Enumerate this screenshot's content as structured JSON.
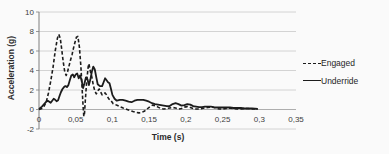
{
  "chart_data": {
    "type": "line",
    "title": "",
    "xlabel": "Time (s)",
    "ylabel": "Acceleration (g)",
    "xlim": [
      0,
      0.35
    ],
    "ylim": [
      -2,
      10
    ],
    "grid": "horizontal",
    "legend_position": "right",
    "decimal_separator": ",",
    "x_ticks": [
      {
        "value": 0,
        "label": "0"
      },
      {
        "value": 0.05,
        "label": "0,05"
      },
      {
        "value": 0.1,
        "label": "0,1"
      },
      {
        "value": 0.15,
        "label": "0,15"
      },
      {
        "value": 0.2,
        "label": "0,2"
      },
      {
        "value": 0.25,
        "label": "0,25"
      },
      {
        "value": 0.3,
        "label": "0,3"
      },
      {
        "value": 0.35,
        "label": "0,35"
      }
    ],
    "y_ticks": [
      {
        "value": -2,
        "label": "-2"
      },
      {
        "value": 0,
        "label": "0"
      },
      {
        "value": 2,
        "label": "2"
      },
      {
        "value": 4,
        "label": "4"
      },
      {
        "value": 6,
        "label": "6"
      },
      {
        "value": 8,
        "label": "8"
      },
      {
        "value": 10,
        "label": "10"
      }
    ],
    "colors": {
      "line": "#1c1c1c",
      "grid": "#c9c9c9",
      "zero_axis": "#9a9a9a",
      "axis": "#7f7f7f",
      "tick_text": "#3d3d3d"
    },
    "series": [
      {
        "name": "Engaged",
        "style": "dashed",
        "points": [
          [
            0,
            0
          ],
          [
            0.004,
            0.1
          ],
          [
            0.007,
            0.35
          ],
          [
            0.01,
            0.8
          ],
          [
            0.013,
            1.7
          ],
          [
            0.016,
            2.9
          ],
          [
            0.019,
            4.3
          ],
          [
            0.022,
            6.0
          ],
          [
            0.025,
            7.3
          ],
          [
            0.027,
            7.7
          ],
          [
            0.029,
            7.3
          ],
          [
            0.031,
            6.1
          ],
          [
            0.033,
            4.9
          ],
          [
            0.035,
            3.9
          ],
          [
            0.037,
            3.5
          ],
          [
            0.039,
            3.9
          ],
          [
            0.041,
            4.5
          ],
          [
            0.043,
            5.1
          ],
          [
            0.045,
            5.6
          ],
          [
            0.047,
            6.3
          ],
          [
            0.049,
            6.9
          ],
          [
            0.051,
            7.4
          ],
          [
            0.053,
            7.5
          ],
          [
            0.055,
            6.4
          ],
          [
            0.057,
            4.4
          ],
          [
            0.059,
            1.8
          ],
          [
            0.06,
            0.3
          ],
          [
            0.061,
            -0.7
          ],
          [
            0.062,
            -0.4
          ],
          [
            0.063,
            0.9
          ],
          [
            0.065,
            2.9
          ],
          [
            0.067,
            4.4
          ],
          [
            0.068,
            4.7
          ],
          [
            0.07,
            3.9
          ],
          [
            0.072,
            3.3
          ],
          [
            0.074,
            2.5
          ],
          [
            0.076,
            1.9
          ],
          [
            0.078,
            1.6
          ],
          [
            0.08,
            1.9
          ],
          [
            0.082,
            2.1
          ],
          [
            0.084,
            1.8
          ],
          [
            0.086,
            1.5
          ],
          [
            0.088,
            1.6
          ],
          [
            0.09,
            1.7
          ],
          [
            0.092,
            1.5
          ],
          [
            0.095,
            1.1
          ],
          [
            0.098,
            0.9
          ],
          [
            0.101,
            0.6
          ],
          [
            0.104,
            0.5
          ],
          [
            0.107,
            0.4
          ],
          [
            0.11,
            0.3
          ],
          [
            0.113,
            0.2
          ],
          [
            0.116,
            0.1
          ],
          [
            0.12,
            0
          ],
          [
            0.124,
            -0.1
          ],
          [
            0.128,
            -0.2
          ],
          [
            0.132,
            -0.3
          ],
          [
            0.136,
            -0.35
          ],
          [
            0.14,
            -0.3
          ],
          [
            0.144,
            -0.15
          ],
          [
            0.148,
            0.1
          ],
          [
            0.152,
            0.35
          ],
          [
            0.155,
            0.45
          ],
          [
            0.158,
            0.4
          ],
          [
            0.162,
            0.25
          ],
          [
            0.166,
            0.1
          ],
          [
            0.17,
            0.05
          ],
          [
            0.174,
            0.1
          ],
          [
            0.178,
            0.15
          ],
          [
            0.182,
            0.2
          ],
          [
            0.186,
            0.15
          ],
          [
            0.19,
            0.05
          ],
          [
            0.194,
            0.1
          ],
          [
            0.198,
            0.25
          ],
          [
            0.202,
            0.3
          ],
          [
            0.206,
            0.2
          ],
          [
            0.21,
            0.1
          ],
          [
            0.214,
            0.05
          ],
          [
            0.218,
            0.05
          ],
          [
            0.222,
            0.1
          ],
          [
            0.226,
            0.15
          ],
          [
            0.23,
            0.2
          ],
          [
            0.234,
            0.25
          ],
          [
            0.238,
            0.2
          ],
          [
            0.242,
            0.1
          ],
          [
            0.246,
            0.05
          ],
          [
            0.25,
            0.05
          ],
          [
            0.255,
            0.1
          ],
          [
            0.26,
            0.15
          ],
          [
            0.265,
            0.1
          ],
          [
            0.27,
            0.05
          ],
          [
            0.275,
            0.05
          ],
          [
            0.28,
            0.1
          ],
          [
            0.285,
            0.1
          ],
          [
            0.29,
            0.05
          ],
          [
            0.294,
            0.05
          ],
          [
            0.298,
            0.05
          ]
        ]
      },
      {
        "name": "Underride",
        "style": "solid",
        "points": [
          [
            0,
            0.05
          ],
          [
            0.004,
            0.3
          ],
          [
            0.007,
            0.55
          ],
          [
            0.01,
            0.8
          ],
          [
            0.012,
            0.9
          ],
          [
            0.014,
            0.8
          ],
          [
            0.016,
            0.7
          ],
          [
            0.018,
            0.9
          ],
          [
            0.02,
            1.1
          ],
          [
            0.022,
            1.0
          ],
          [
            0.024,
            0.85
          ],
          [
            0.026,
            0.95
          ],
          [
            0.028,
            1.4
          ],
          [
            0.03,
            1.8
          ],
          [
            0.032,
            2.1
          ],
          [
            0.034,
            2.3
          ],
          [
            0.036,
            2.4
          ],
          [
            0.038,
            2.3
          ],
          [
            0.04,
            2.5
          ],
          [
            0.042,
            3.0
          ],
          [
            0.044,
            3.5
          ],
          [
            0.046,
            3.6
          ],
          [
            0.048,
            3.3
          ],
          [
            0.05,
            3.6
          ],
          [
            0.052,
            3.7
          ],
          [
            0.054,
            3.2
          ],
          [
            0.056,
            3.5
          ],
          [
            0.058,
            3.0
          ],
          [
            0.06,
            2.2
          ],
          [
            0.062,
            2.7
          ],
          [
            0.064,
            3.3
          ],
          [
            0.066,
            3.1
          ],
          [
            0.068,
            2.5
          ],
          [
            0.07,
            3.1
          ],
          [
            0.072,
            3.9
          ],
          [
            0.074,
            4.4
          ],
          [
            0.076,
            4.1
          ],
          [
            0.078,
            3.3
          ],
          [
            0.08,
            2.6
          ],
          [
            0.083,
            2.4
          ],
          [
            0.086,
            2.4
          ],
          [
            0.088,
            2.8
          ],
          [
            0.09,
            3.2
          ],
          [
            0.092,
            3.0
          ],
          [
            0.094,
            2.8
          ],
          [
            0.096,
            2.7
          ],
          [
            0.098,
            2.1
          ],
          [
            0.1,
            1.5
          ],
          [
            0.103,
            1.1
          ],
          [
            0.106,
            0.9
          ],
          [
            0.11,
            1.0
          ],
          [
            0.114,
            1.0
          ],
          [
            0.118,
            0.9
          ],
          [
            0.122,
            0.8
          ],
          [
            0.126,
            0.75
          ],
          [
            0.13,
            0.9
          ],
          [
            0.134,
            1.0
          ],
          [
            0.138,
            1.0
          ],
          [
            0.142,
            1.0
          ],
          [
            0.146,
            0.9
          ],
          [
            0.15,
            0.8
          ],
          [
            0.154,
            0.65
          ],
          [
            0.158,
            0.55
          ],
          [
            0.162,
            0.5
          ],
          [
            0.166,
            0.45
          ],
          [
            0.17,
            0.4
          ],
          [
            0.174,
            0.35
          ],
          [
            0.178,
            0.35
          ],
          [
            0.182,
            0.55
          ],
          [
            0.186,
            0.65
          ],
          [
            0.19,
            0.55
          ],
          [
            0.194,
            0.4
          ],
          [
            0.198,
            0.45
          ],
          [
            0.202,
            0.55
          ],
          [
            0.206,
            0.5
          ],
          [
            0.21,
            0.35
          ],
          [
            0.214,
            0.3
          ],
          [
            0.218,
            0.25
          ],
          [
            0.222,
            0.25
          ],
          [
            0.226,
            0.3
          ],
          [
            0.23,
            0.3
          ],
          [
            0.234,
            0.3
          ],
          [
            0.238,
            0.25
          ],
          [
            0.242,
            0.2
          ],
          [
            0.246,
            0.2
          ],
          [
            0.25,
            0.2
          ],
          [
            0.255,
            0.2
          ],
          [
            0.26,
            0.2
          ],
          [
            0.265,
            0.15
          ],
          [
            0.27,
            0.15
          ],
          [
            0.275,
            0.15
          ],
          [
            0.28,
            0.1
          ],
          [
            0.285,
            0.1
          ],
          [
            0.29,
            0.1
          ],
          [
            0.294,
            0.08
          ],
          [
            0.298,
            0.05
          ]
        ]
      }
    ]
  }
}
